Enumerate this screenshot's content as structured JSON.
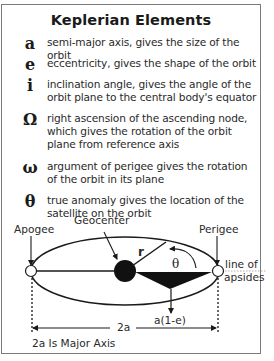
{
  "title": "Keplerian Elements",
  "elements": [
    {
      "symbol": "a",
      "description": "semi-major axis, gives the size of the orbit"
    },
    {
      "symbol": "e",
      "description": "eccentricity, gives the shape of the orbit"
    },
    {
      "symbol": "i",
      "description": "inclination angle, gives the angle of the orbit plane to the central body's equator"
    },
    {
      "symbol": "Ω",
      "description": "right ascension of the ascending node, which gives the rotation of the orbit plane from reference axis"
    },
    {
      "symbol": "ω",
      "description": "argument of perigee gives the rotation of the orbit in its plane"
    },
    {
      "symbol": "θ",
      "description": "true anomaly gives the location of the satellite on the orbit"
    }
  ],
  "diagram": {
    "labels": {
      "apogee": "Apogee",
      "perigee": "Perigee",
      "geocenter": "Geocenter",
      "radius": "r",
      "true_anomaly": "θ",
      "line_of_apsides_1": "line of",
      "line_of_apsides_2": "apsides",
      "perigee_distance": "a(1-e)",
      "major_axis_length": "2a",
      "caption": "2a Is Major Axis"
    }
  }
}
